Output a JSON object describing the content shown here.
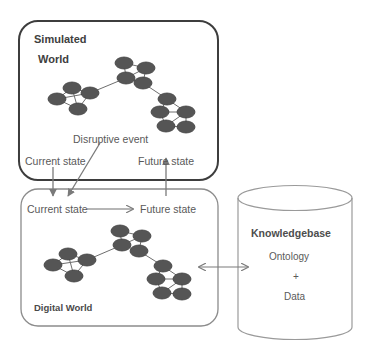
{
  "diagram": {
    "title_simulated_line1": "Simulated",
    "title_simulated_line2": "World",
    "title_digital": "Digital World",
    "disruptive_event_label": "Disruptive event",
    "sim_current_state_label": "Current state",
    "sim_future_state_label": "Future state",
    "dw_current_state_label": "Current state",
    "dw_future_state_label": "Future state",
    "knowledgebase": {
      "title": "Knowledgebase",
      "line1": "Ontology",
      "line2": "+",
      "line3": "Data"
    },
    "colors": {
      "node_fill": "#555555",
      "node_stroke": "#3f3f3f",
      "edge": "#6e6e6e",
      "sim_box_border": "#3d3d3d",
      "digital_box_border": "#8c8c8c",
      "cylinder_border": "#9a9a9a",
      "arrow": "#7a7a7a",
      "text": "#595959",
      "background": "#ffffff"
    },
    "graph": {
      "node_count_simulated": 14,
      "node_count_digital": 14,
      "clusters": 3,
      "description": "three interconnected node clusters forming a network chain"
    }
  }
}
